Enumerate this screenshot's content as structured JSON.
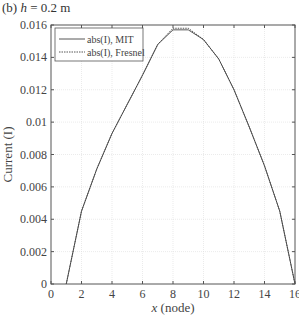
{
  "panel_label": "(b) h = 0.2 m",
  "panel_prefix": "(b) ",
  "panel_var": "h",
  "panel_rest": " = 0.2 m",
  "colors": {
    "line": "#444444",
    "grid": "#dddddd",
    "axis": "#555555"
  },
  "chart_data": {
    "type": "line",
    "title": "(b) h = 0.2 m",
    "xlabel": "x (node)",
    "ylabel": "Current (I)",
    "xlim": [
      0,
      16
    ],
    "ylim": [
      0,
      0.016
    ],
    "xticks": [
      0,
      2,
      4,
      6,
      8,
      10,
      12,
      14,
      16
    ],
    "yticks": [
      0,
      0.002,
      0.004,
      0.006,
      0.008,
      0.01,
      0.012,
      0.014,
      0.016
    ],
    "ytick_labels": [
      "0",
      "0.002",
      "0.004",
      "0.006",
      "0.008",
      "0.01",
      "0.012",
      "0.014",
      "0.016"
    ],
    "grid": true,
    "legend_position": "upper left",
    "x": [
      1,
      2,
      3,
      4,
      5,
      6,
      7,
      8,
      9,
      10,
      11,
      12,
      13,
      14,
      15,
      16
    ],
    "series": [
      {
        "name": "abs(I), MIT",
        "style": "solid",
        "values": [
          0,
          0.0045,
          0.0071,
          0.0093,
          0.0111,
          0.0129,
          0.0148,
          0.0157,
          0.0157,
          0.0151,
          0.0139,
          0.012,
          0.0097,
          0.0073,
          0.0045,
          0
        ]
      },
      {
        "name": "abs(I), Fresnel",
        "style": "dotted",
        "values": [
          0,
          0.0045,
          0.0071,
          0.0093,
          0.0111,
          0.0129,
          0.0148,
          0.0158,
          0.0158,
          0.0151,
          0.0139,
          0.012,
          0.0097,
          0.0073,
          0.0045,
          0
        ]
      }
    ]
  }
}
